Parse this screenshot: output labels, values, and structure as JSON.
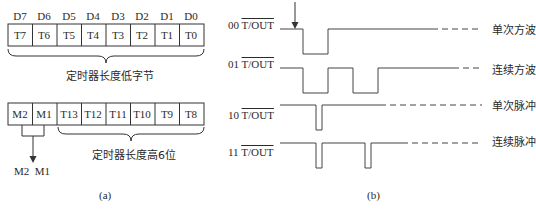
{
  "panel_a": {
    "caption": "(a)",
    "low_byte": {
      "bit_labels": [
        "D7",
        "D6",
        "D5",
        "D4",
        "D3",
        "D2",
        "D1",
        "D0"
      ],
      "cells": [
        "T7",
        "T6",
        "T5",
        "T4",
        "T3",
        "T2",
        "T1",
        "T0"
      ],
      "brace_label": "定时器长度低字节"
    },
    "high_byte": {
      "cells": [
        "M2",
        "M1",
        "T13",
        "T12",
        "T11",
        "T10",
        "T9",
        "T8"
      ],
      "brace_label": "定时器长度高6位",
      "mode_label": "M2  M1"
    }
  },
  "panel_b": {
    "caption": "(b)",
    "signals": [
      {
        "mode": "00",
        "signal": "T/OUT",
        "label": "单次方波"
      },
      {
        "mode": "01",
        "signal": "T/OUT",
        "label": "连续方波"
      },
      {
        "mode": "10",
        "signal": "T/OUT",
        "label": "单次脉冲"
      },
      {
        "mode": "11",
        "signal": "T/OUT",
        "label": "连续脉冲"
      }
    ]
  }
}
